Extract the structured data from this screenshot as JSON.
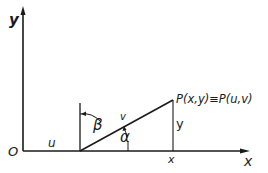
{
  "diagram": {
    "type": "coordinate-geometry",
    "axes": {
      "y_label": "y",
      "x_label": "x",
      "origin_label": "O"
    },
    "labels": {
      "u": "u",
      "beta": "β",
      "v": "v",
      "alpha": "α",
      "y_height": "y",
      "x_foot": "x",
      "point": "P(x,y)≡P(u,v)"
    },
    "colors": {
      "ink": "#1a1a1a",
      "background": "#ffffff"
    }
  }
}
